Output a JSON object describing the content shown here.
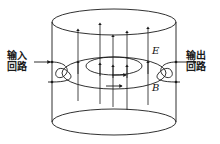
{
  "figure": {
    "background_color": "#ffffff",
    "line_color": "#1a1a1a",
    "width": 220,
    "height": 144
  },
  "labels": {
    "input_circuit": {
      "line1": "输入",
      "line2": "回路",
      "meaning": "input circuit"
    },
    "output_circuit": {
      "line1": "输出",
      "line2": "回路",
      "meaning": "output circuit"
    },
    "electric_field": "E",
    "magnetic_field": "B"
  },
  "diagram": {
    "cylinder": {
      "center_x": 114,
      "left_x": 52,
      "right_x": 176,
      "top_ellipse_cy": 22,
      "bottom_ellipse_cy": 122,
      "rx": 62,
      "ry": 13
    },
    "e_field_lines": {
      "count": 5,
      "x_positions": [
        78,
        100,
        113,
        127,
        148
      ],
      "direction": "upward",
      "arrow_y": 66
    },
    "b_field_rings": {
      "count": 2,
      "outer_rx": 52,
      "outer_ry": 15,
      "inner_rx": 28,
      "inner_ry": 9,
      "cy": 72,
      "direction": "clockwise-from-above"
    },
    "coupling_loops": {
      "left": {
        "x": 58,
        "y": 70,
        "name": "input coupling loop"
      },
      "right": {
        "x": 170,
        "y": 70,
        "name": "output coupling loop"
      }
    },
    "lead_arrows": {
      "left": {
        "from_x": 32,
        "to_x": 52,
        "y": 62
      },
      "right": {
        "from_x": 176,
        "to_x": 198,
        "y": 62
      }
    }
  }
}
